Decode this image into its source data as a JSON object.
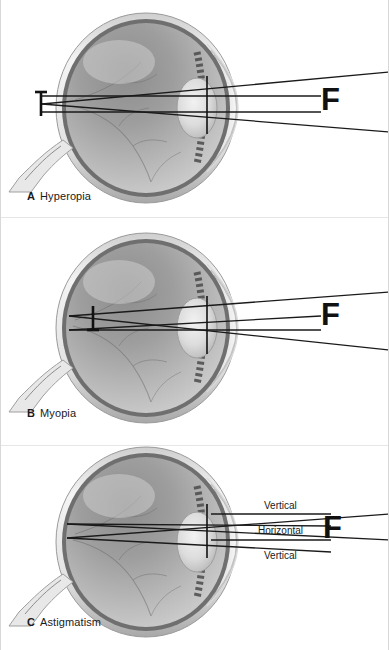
{
  "figure": {
    "background_color": "#ffffff",
    "border_color": "#d8d8d8",
    "ray_color": "#1a1a1a",
    "width": 389,
    "height": 650
  },
  "panels": [
    {
      "id": "a",
      "letter": "A",
      "label": "Hyperopia",
      "focal_letter": "F",
      "focal_position": "behind the retina",
      "ray_labels": []
    },
    {
      "id": "b",
      "letter": "B",
      "label": "Myopia",
      "focal_letter": "F",
      "focal_position": "in front of the retina",
      "ray_labels": []
    },
    {
      "id": "c",
      "letter": "C",
      "label": "Astigmatism",
      "focal_letter": "F",
      "focal_position": "two focal lines",
      "ray_labels": [
        {
          "id": "vertical-top",
          "text": "Vertical"
        },
        {
          "id": "horizontal",
          "text": "Horizontal"
        },
        {
          "id": "vertical-bottom",
          "text": "Vertical"
        }
      ]
    }
  ]
}
